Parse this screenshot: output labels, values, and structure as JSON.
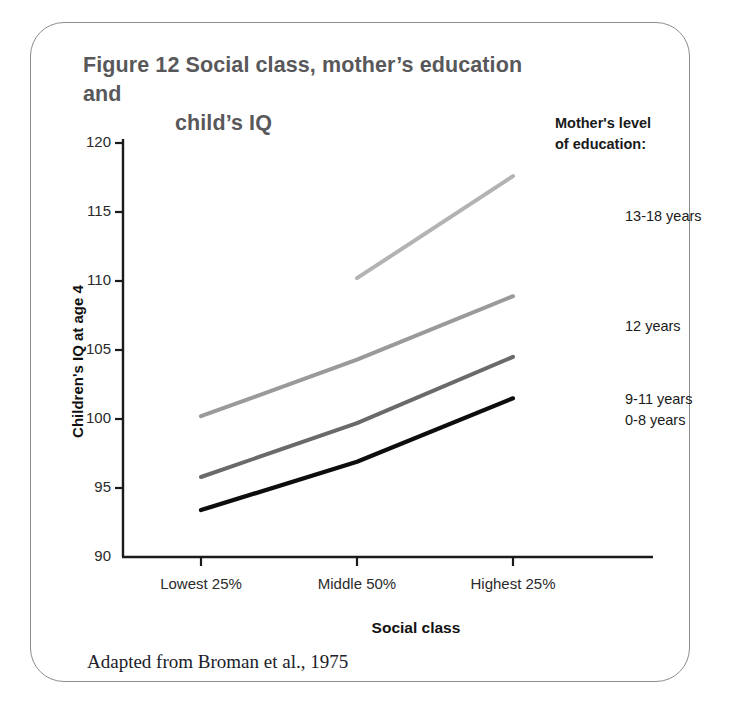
{
  "figure": {
    "title_line1": "Figure 12  Social class, mother’s education and",
    "title_line2": "child’s IQ",
    "source_caption": "Adapted from Broman et al., 1975"
  },
  "legend": {
    "header_line1": "Mother's level",
    "header_line2": "of education:"
  },
  "colors": {
    "series_13_18": "#b3b3b3",
    "series_12": "#9a9a9a",
    "series_9_11": "#6a6a6a",
    "series_0_8": "#0d0d0d",
    "axis": "#1a1a1a",
    "title": "#58585a",
    "card_border": "#8d8d8d"
  },
  "chart_data": {
    "type": "line",
    "title": "Figure 12  Social class, mother’s education and child’s IQ",
    "xlabel": "Social class",
    "ylabel": "Children's IQ at age 4",
    "categories": [
      "Lowest 25%",
      "Middle 50%",
      "Highest 25%"
    ],
    "ylim": [
      90,
      120
    ],
    "yticks": [
      90,
      95,
      100,
      105,
      110,
      115,
      120
    ],
    "ytick_labels": [
      "90",
      "95",
      "100",
      "105",
      "110",
      "115",
      "120"
    ],
    "grid": false,
    "legend_position": "right",
    "legend_title": "Mother's level of education:",
    "series": [
      {
        "name": "13-18 years",
        "color": "#b3b3b3",
        "x": [
          "Middle 50%",
          "Highest 25%"
        ],
        "values": [
          110.2,
          117.6
        ]
      },
      {
        "name": "12 years",
        "color": "#9a9a9a",
        "x": [
          "Lowest 25%",
          "Middle 50%",
          "Highest 25%"
        ],
        "values": [
          100.2,
          104.3,
          108.9
        ]
      },
      {
        "name": "9-11 years",
        "color": "#6a6a6a",
        "x": [
          "Lowest 25%",
          "Middle 50%",
          "Highest 25%"
        ],
        "values": [
          95.8,
          99.7,
          104.5
        ]
      },
      {
        "name": "0-8 years",
        "color": "#0d0d0d",
        "x": [
          "Lowest 25%",
          "Middle 50%",
          "Highest 25%"
        ],
        "values": [
          93.4,
          96.9,
          101.5
        ]
      }
    ]
  }
}
